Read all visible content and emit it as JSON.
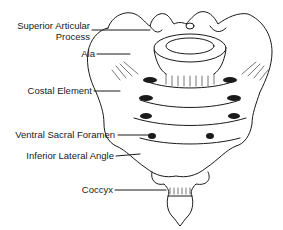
{
  "diagram": {
    "labels": [
      {
        "id": "superior-articular-process",
        "text_line1": "Superior Articular",
        "text_line2": "Process"
      },
      {
        "id": "ala",
        "text": "Ala"
      },
      {
        "id": "costal-element",
        "text": "Costal Element"
      },
      {
        "id": "ventral-sacral-foramen",
        "text": "Ventral Sacral Foramen"
      },
      {
        "id": "inferior-lateral-angle",
        "text": "Inferior Lateral Angle"
      },
      {
        "id": "coccyx",
        "text": "Coccyx"
      }
    ],
    "colors": {
      "ink": "#1a1a1a",
      "background": "#ffffff"
    }
  }
}
